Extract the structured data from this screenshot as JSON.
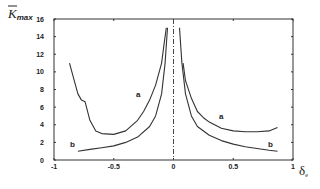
{
  "chart_data": {
    "type": "line",
    "title": "",
    "xlabel": "δe",
    "ylabel": "K̄max",
    "xlim": [
      -1,
      1
    ],
    "ylim": [
      0,
      16
    ],
    "grid": false,
    "x_ticks": [
      "-1",
      "-0.5",
      "0",
      "0.5",
      "1"
    ],
    "y_ticks": [
      "0",
      "2",
      "4",
      "6",
      "8",
      "10",
      "12",
      "14",
      "16"
    ],
    "vertical_reference_line": {
      "x": 0,
      "style": "dash-dot"
    },
    "series": [
      {
        "name": "a",
        "segments": [
          {
            "x": [
              -0.87,
              -0.84,
              -0.8,
              -0.77,
              -0.74,
              -0.7,
              -0.65,
              -0.6,
              -0.5,
              -0.4,
              -0.3,
              -0.25,
              -0.2,
              -0.15,
              -0.1,
              -0.08,
              -0.06
            ],
            "y": [
              11,
              9.5,
              7.5,
              6.8,
              6.6,
              4.5,
              3.3,
              3.0,
              2.9,
              3.3,
              4.5,
              5.5,
              6.8,
              8.5,
              11,
              13,
              15
            ]
          },
          {
            "x": [
              0.08,
              0.1,
              0.15,
              0.2,
              0.25,
              0.3,
              0.4,
              0.5,
              0.6,
              0.7,
              0.8,
              0.87
            ],
            "y": [
              11,
              9,
              7,
              5.5,
              4.8,
              4.3,
              3.6,
              3.3,
              3.2,
              3.2,
              3.3,
              3.7
            ]
          }
        ],
        "label_pos": {
          "x": -0.25,
          "y": 7.5
        }
      },
      {
        "name": "b",
        "segments": [
          {
            "x": [
              -0.8,
              -0.7,
              -0.6,
              -0.5,
              -0.4,
              -0.3,
              -0.2,
              -0.15,
              -0.1,
              -0.07,
              -0.05
            ],
            "y": [
              1.0,
              1.2,
              1.4,
              1.6,
              2.0,
              2.6,
              3.8,
              5.0,
              7.5,
              11,
              15
            ]
          },
          {
            "x": [
              0.05,
              0.07,
              0.1,
              0.15,
              0.2,
              0.3,
              0.4,
              0.5,
              0.6,
              0.7,
              0.8,
              0.87
            ],
            "y": [
              15,
              11,
              7.5,
              5.0,
              3.8,
              2.8,
              2.2,
              1.8,
              1.5,
              1.3,
              1.1,
              1.0
            ]
          }
        ],
        "label_pos": {
          "x": -0.72,
          "y": 1.8
        }
      }
    ],
    "series_labels": {
      "a": "a",
      "b": "b",
      "a_right": "a",
      "b_right": "b"
    }
  },
  "axis": {
    "ylabel_main": "K",
    "ylabel_sub": "max",
    "xlabel_main": "δ",
    "xlabel_sub": "e"
  }
}
